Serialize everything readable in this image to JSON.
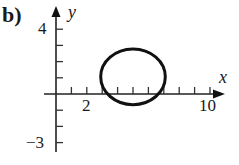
{
  "panel_label": "b)",
  "chart_data": {
    "type": "line",
    "title": "",
    "xlabel": "x",
    "ylabel": "y",
    "xlim": [
      0,
      10.5
    ],
    "ylim": [
      -3,
      4.5
    ],
    "grid": false,
    "legend": null,
    "x_ticks": [
      1,
      2,
      3,
      4,
      5,
      6,
      7,
      8,
      9,
      10
    ],
    "x_tick_labels": {
      "2": "2",
      "10": "10"
    },
    "y_ticks": [
      -3,
      -2,
      -1,
      1,
      2,
      3,
      4
    ],
    "y_tick_labels": {
      "4": "4",
      "-3": "−3"
    },
    "series": [
      {
        "name": "circle",
        "shape": "circle",
        "center": [
          5,
          1
        ],
        "radius": 2,
        "color": "#111111"
      }
    ]
  },
  "labels": {
    "x_axis": "x",
    "y_axis": "y",
    "x_tick_2": "2",
    "x_tick_10": "10",
    "y_tick_4": "4",
    "y_tick_neg3": "−3"
  }
}
